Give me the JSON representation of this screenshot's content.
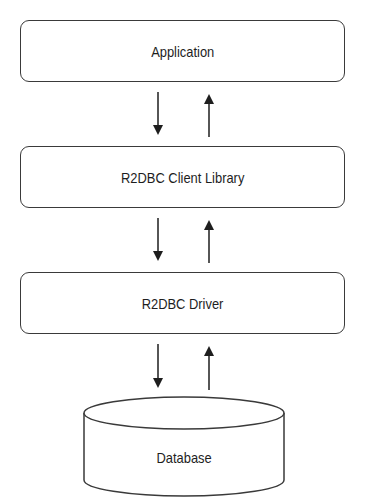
{
  "diagram": {
    "layers": [
      {
        "id": "application",
        "label": "Application"
      },
      {
        "id": "client-library",
        "label": "R2DBC Client Library"
      },
      {
        "id": "driver",
        "label": "R2DBC Driver"
      }
    ],
    "database": {
      "label": "Database"
    },
    "connections": [
      {
        "from": "Application",
        "to": "R2DBC Client Library",
        "direction": "bidirectional"
      },
      {
        "from": "R2DBC Client Library",
        "to": "R2DBC Driver",
        "direction": "bidirectional"
      },
      {
        "from": "R2DBC Driver",
        "to": "Database",
        "direction": "bidirectional"
      }
    ],
    "colors": {
      "stroke": "#3a3a3a",
      "background": "#ffffff",
      "text": "#1e1e1e"
    }
  }
}
